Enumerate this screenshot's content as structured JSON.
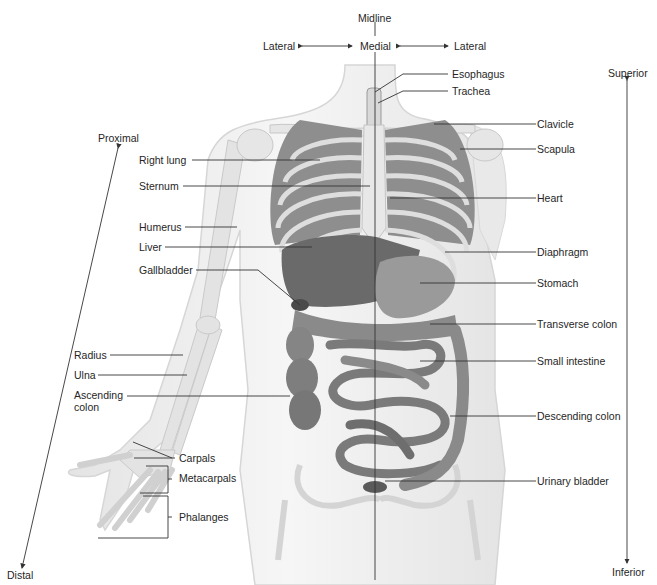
{
  "diagram": {
    "orientation": {
      "midline": "Midline",
      "medial": "Medial",
      "lateral_left": "Lateral",
      "lateral_right": "Lateral",
      "superior": "Superior",
      "inferior": "Inferior",
      "proximal": "Proximal",
      "distal": "Distal"
    },
    "labels_left": [
      {
        "id": "right-lung",
        "text": "Right lung"
      },
      {
        "id": "sternum",
        "text": "Sternum"
      },
      {
        "id": "humerus",
        "text": "Humerus"
      },
      {
        "id": "liver",
        "text": "Liver"
      },
      {
        "id": "gallbladder",
        "text": "Gallbladder"
      },
      {
        "id": "radius",
        "text": "Radius"
      },
      {
        "id": "ulna",
        "text": "Ulna"
      },
      {
        "id": "ascending-colon",
        "text": "Ascending colon"
      },
      {
        "id": "carpals",
        "text": "Carpals"
      },
      {
        "id": "metacarpals",
        "text": "Metacarpals"
      },
      {
        "id": "phalanges",
        "text": "Phalanges"
      }
    ],
    "labels_right": [
      {
        "id": "esophagus",
        "text": "Esophagus"
      },
      {
        "id": "trachea",
        "text": "Trachea"
      },
      {
        "id": "clavicle",
        "text": "Clavicle"
      },
      {
        "id": "scapula",
        "text": "Scapula"
      },
      {
        "id": "heart",
        "text": "Heart"
      },
      {
        "id": "diaphragm",
        "text": "Diaphragm"
      },
      {
        "id": "stomach",
        "text": "Stomach"
      },
      {
        "id": "transverse-colon",
        "text": "Transverse colon"
      },
      {
        "id": "small-intestine",
        "text": "Small intestine"
      },
      {
        "id": "descending-colon",
        "text": "Descending colon"
      },
      {
        "id": "urinary-bladder",
        "text": "Urinary bladder"
      }
    ],
    "colors": {
      "text": "#262626",
      "leader_line": "#333333",
      "body_silhouette": "#ececec",
      "bone": "#e2e2e2",
      "organ_dark": "#6e6e6e",
      "organ_mid": "#8c8c8c",
      "organ_light": "#a8a8a8"
    }
  }
}
